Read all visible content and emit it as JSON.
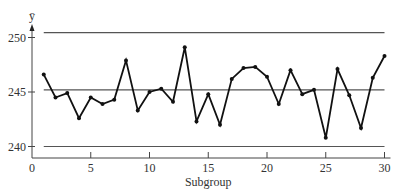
{
  "chart_data": {
    "type": "line",
    "title": "",
    "ylabel": "ȳ",
    "xlabel": "Subgroup",
    "x": [
      1,
      2,
      3,
      4,
      5,
      6,
      7,
      8,
      9,
      10,
      11,
      12,
      13,
      14,
      15,
      16,
      17,
      18,
      19,
      20,
      21,
      22,
      23,
      24,
      25,
      26,
      27,
      28,
      29,
      30
    ],
    "series": [
      {
        "name": "Subgroup mean",
        "values": [
          246.6,
          244.5,
          244.9,
          242.6,
          244.5,
          243.9,
          244.3,
          247.9,
          243.3,
          245.0,
          245.3,
          244.1,
          249.1,
          242.3,
          244.8,
          242.0,
          246.2,
          247.2,
          247.3,
          246.4,
          243.9,
          247.0,
          244.8,
          245.2,
          240.8,
          247.1,
          244.7,
          241.7,
          246.3,
          248.3
        ]
      }
    ],
    "control_limits": {
      "ucl": 250.45,
      "center": 245.2,
      "lcl": 240.0
    },
    "xticks": [
      0,
      5,
      10,
      15,
      20,
      25,
      30
    ],
    "yticks": [
      240,
      245,
      250
    ],
    "xlim": [
      0,
      30
    ],
    "ylim": [
      239,
      251
    ],
    "grid": false,
    "legend": "none"
  },
  "colors": {
    "line": "#111111",
    "control_line": "#555555",
    "axis": "#444444",
    "text": "#333333"
  }
}
